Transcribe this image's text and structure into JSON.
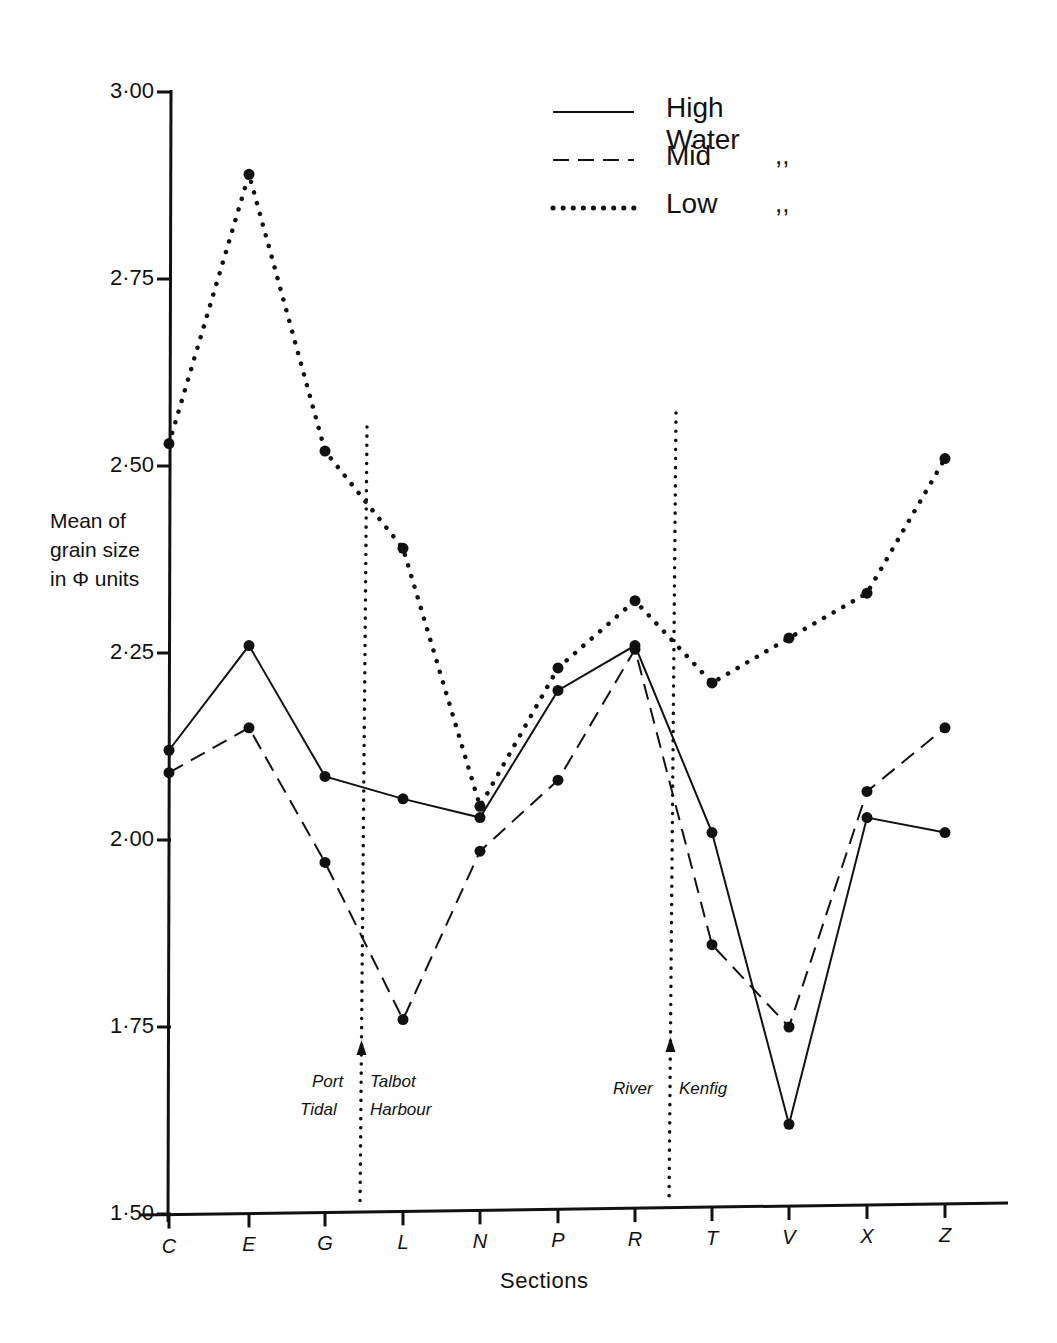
{
  "chart_data": {
    "type": "line",
    "title": "",
    "xlabel": "Sections",
    "ylabel": "Mean of grain size in Φ units",
    "ylabel_lines": [
      "Mean of",
      "grain size",
      "in Φ units"
    ],
    "ylim": [
      1.5,
      3.0
    ],
    "yticks": [
      "3·00",
      "2·75",
      "2·50",
      "2·25",
      "2·00",
      "1·75",
      "1·50"
    ],
    "ytick_values": [
      3.0,
      2.75,
      2.5,
      2.25,
      2.0,
      1.75,
      1.5
    ],
    "grid": false,
    "legend_position": "top-right",
    "categories": [
      "C",
      "E",
      "G",
      "L",
      "N",
      "P",
      "R",
      "T",
      "V",
      "X",
      "Z"
    ],
    "series": [
      {
        "name": "High Water",
        "style": "solid",
        "values": [
          2.12,
          2.26,
          2.085,
          2.055,
          2.03,
          2.2,
          2.26,
          2.01,
          1.62,
          2.03,
          2.01
        ]
      },
      {
        "name": "Mid",
        "style": "dashed",
        "values": [
          2.09,
          2.15,
          1.97,
          1.76,
          1.985,
          2.08,
          2.255,
          1.86,
          1.75,
          2.065,
          2.15
        ]
      },
      {
        "name": "Low",
        "style": "dotted",
        "values": [
          2.53,
          2.89,
          2.52,
          2.39,
          2.045,
          2.23,
          2.32,
          2.21,
          2.27,
          2.33,
          2.51
        ]
      }
    ],
    "legend": [
      {
        "label": "High Water",
        "ditto": ""
      },
      {
        "label": "Mid",
        "ditto": ",,"
      },
      {
        "label": "Low",
        "ditto": ",,"
      }
    ],
    "annotations": [
      {
        "position": "between G and L",
        "left_lines": [
          "Port",
          "Tidal"
        ],
        "right_lines": [
          "Talbot",
          "Harbour"
        ]
      },
      {
        "position": "between R and T",
        "left_lines": [
          "River"
        ],
        "right_lines": [
          "Kenfig"
        ]
      }
    ]
  }
}
